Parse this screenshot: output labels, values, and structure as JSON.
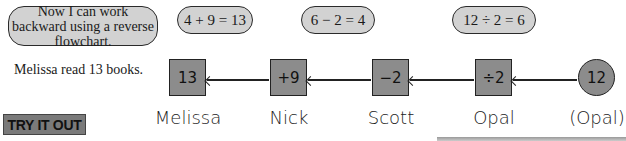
{
  "speech_bubble": "Now I can work backward using a reverse flowchart.",
  "equations": [
    "4 + 9 = 13",
    "6 − 2 = 4",
    "12 ÷ 2 = 6"
  ],
  "caption": "Melissa read 13 books.",
  "flowchart": {
    "nodes": [
      {
        "value": "13",
        "label": "Melissa",
        "shape": "square"
      },
      {
        "value": "+9",
        "label": "Nick",
        "shape": "square"
      },
      {
        "value": "−2",
        "label": "Scott",
        "shape": "square"
      },
      {
        "value": "÷2",
        "label": "Opal",
        "shape": "square"
      },
      {
        "value": "12",
        "label": "(Opal)",
        "shape": "circle"
      }
    ],
    "arrow_direction": "right-to-left"
  },
  "section_header": "TRY IT OUT"
}
